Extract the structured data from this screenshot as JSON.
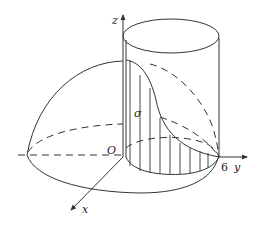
{
  "figure": {
    "axes": {
      "z_label": "z",
      "y_label": "y",
      "x_label": "x",
      "origin_label": "O"
    },
    "tick_labels": {
      "y_tick": "6"
    },
    "region_label": "σ",
    "colors": {
      "line": "#333333",
      "background": "#ffffff"
    }
  }
}
